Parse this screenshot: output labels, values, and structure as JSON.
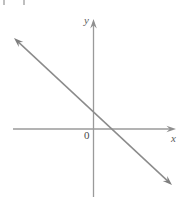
{
  "figure": {
    "background_color": "#ffffff",
    "width": 182,
    "height": 201,
    "axis_color": "#9a9a9a",
    "line_color": "#8b8b8b",
    "label_color": "#5c5c5c"
  },
  "labels": {
    "y_axis": "y",
    "x_axis": "x",
    "origin": "0"
  },
  "chart_data": {
    "type": "line",
    "title": "",
    "subtitle": "",
    "xlabel": "x",
    "ylabel": "y",
    "grid": false,
    "legend": "none",
    "axes": {
      "origin_label": "0",
      "x_axis": {
        "label": "x",
        "arrow_right": true,
        "arrow_left": false,
        "pixel_y": 129,
        "pixel_x_start": 13,
        "pixel_x_end": 176
      },
      "y_axis": {
        "label": "y",
        "arrow_up": true,
        "arrow_down": false,
        "pixel_x": 93,
        "pixel_y_start": 19,
        "pixel_y_end": 197
      }
    },
    "series": [
      {
        "name": "line",
        "description": "straight line with negative slope and positive y-intercept, arrowheads on both ends",
        "arrow_start": true,
        "arrow_end": true,
        "slope_sign": "negative",
        "y_intercept_sign": "positive",
        "x_intercept_sign": "positive",
        "pixel_points": [
          [
            14,
            38
          ],
          [
            172,
            185
          ]
        ],
        "pixel_y_intercept": [
          93,
          112
        ],
        "pixel_x_intercept": [
          115,
          129
        ],
        "x": [
          -3.6,
          1.0,
          5.5
        ],
        "values": [
          2.7,
          0.77,
          -2.3
        ]
      }
    ],
    "xlim": [
      -3.8,
      4.0
    ],
    "ylim": [
      -3.0,
      5.2
    ]
  }
}
